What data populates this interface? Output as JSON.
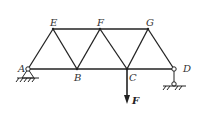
{
  "diagram": {
    "type": "truss",
    "joints": {
      "A": "A",
      "B": "B",
      "C": "C",
      "D": "D",
      "E": "E",
      "F": "F",
      "G": "G"
    },
    "members": [
      "AE",
      "EB",
      "BF",
      "FC",
      "CG",
      "GD",
      "AB",
      "BC",
      "CD",
      "EF",
      "FG"
    ],
    "supports": {
      "A": "pin",
      "D": "roller"
    },
    "load": {
      "label": "F",
      "at": "C",
      "direction": "down"
    }
  }
}
